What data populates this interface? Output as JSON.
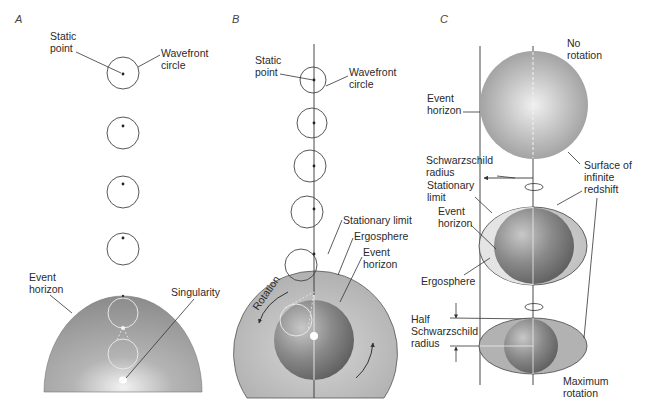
{
  "panels": {
    "A": {
      "label": "A",
      "static_point": "Static\npoint",
      "wavefront_circle": "Wavefront\ncircle",
      "event_horizon": "Event\nhorizon",
      "singularity": "Singularity"
    },
    "B": {
      "label": "B",
      "static_point": "Static\npoint",
      "wavefront_circle": "Wavefront\ncircle",
      "stationary_limit": "Stationary limit",
      "ergosphere": "Ergosphere",
      "event_horizon": "Event\nhorizon",
      "rotation": "Rotation"
    },
    "C": {
      "label": "C",
      "no_rotation": "No\nrotation",
      "event_horizon_top": "Event\nhorizon",
      "schwarzschild_radius": "Schwarzschild\nradius",
      "stationary_limit": "Stationary\nlimit",
      "event_horizon_mid": "Event\nhorizon",
      "ergosphere": "Ergosphere",
      "surface_infinite_redshift": "Surface of\ninfinite\nredshift",
      "half_schwarzschild_radius": "Half\nSchwarzschild\nradius",
      "maximum_rotation": "Maximum\nrotation"
    }
  },
  "colors": {
    "horizon_fill": "#9a9a9a",
    "ergosphere_fill": "#c4c4c4",
    "highlight": "#f4f4f4",
    "line": "#333333"
  }
}
